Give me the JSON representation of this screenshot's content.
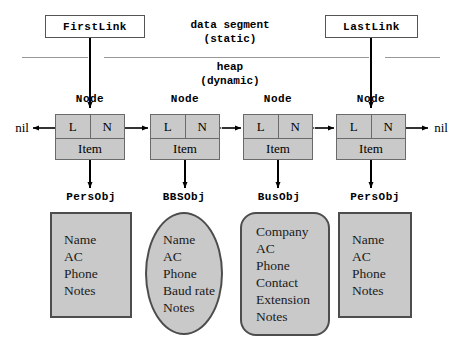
{
  "diagram": {
    "colors": {
      "shape_fill": "#c9c9c9",
      "shape_stroke": "#4d4d4d",
      "node_stroke": "#6a6a6a",
      "divider": "#999999",
      "line": "#000000",
      "background": "#ffffff"
    }
  },
  "memory": {
    "static_segment": {
      "line1": "data segment",
      "line2": "(static)"
    },
    "heap_segment": {
      "line1": "heap",
      "line2": "(dynamic)"
    }
  },
  "pointers": [
    {
      "label": "FirstLink"
    },
    {
      "label": "LastLink"
    }
  ],
  "terminators": {
    "left": "nil",
    "right": "nil"
  },
  "nodes": [
    {
      "type_label": "Node",
      "prev_field": "L",
      "next_field": "N",
      "item_field": "Item"
    },
    {
      "type_label": "Node",
      "prev_field": "L",
      "next_field": "N",
      "item_field": "Item"
    },
    {
      "type_label": "Node",
      "prev_field": "L",
      "next_field": "N",
      "item_field": "Item"
    },
    {
      "type_label": "Node",
      "prev_field": "L",
      "next_field": "N",
      "item_field": "Item"
    }
  ],
  "objects": [
    {
      "type_label": "PersObj",
      "shape": "rect",
      "fields": [
        "Name",
        "AC",
        "Phone",
        "Notes"
      ]
    },
    {
      "type_label": "BBSObj",
      "shape": "ellipse",
      "fields": [
        "Name",
        "AC",
        "Phone",
        "Baud rate",
        "Notes"
      ]
    },
    {
      "type_label": "BusObj",
      "shape": "rounded",
      "fields": [
        "Company",
        "AC",
        "Phone",
        "Contact",
        "Extension",
        "Notes"
      ]
    },
    {
      "type_label": "PersObj",
      "shape": "rect",
      "fields": [
        "Name",
        "AC",
        "Phone",
        "Notes"
      ]
    }
  ]
}
